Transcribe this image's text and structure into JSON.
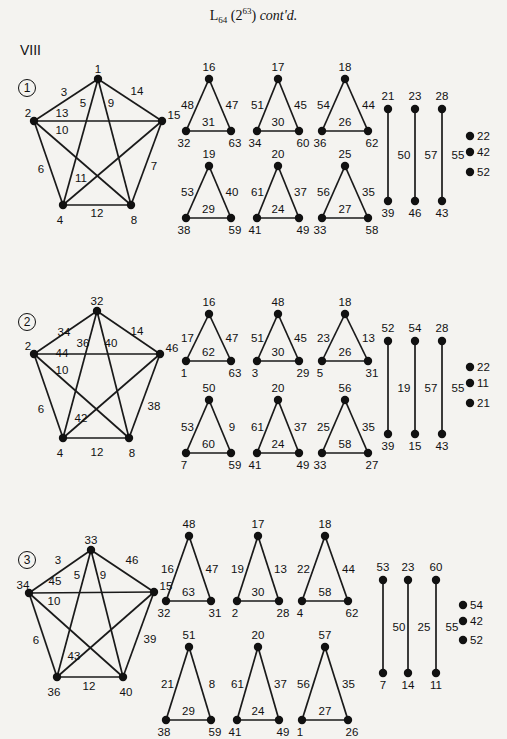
{
  "header": {
    "title_main": "L",
    "title_sub": "64",
    "title_paren_open": " (2",
    "title_sup": "63",
    "title_paren_close": ") ",
    "title_italic": "cont'd.",
    "section_roman": "VIII"
  },
  "graphs": [
    {
      "id": "1",
      "circle_label": "1",
      "pentagon": {
        "vertices": {
          "top": "1",
          "left": "2",
          "right": "15",
          "bottom_left": "4",
          "bottom_right": "8"
        },
        "edges": {
          "top-left": "3",
          "top-right": "14",
          "left-right": "13",
          "top-bottom_left": "5",
          "top-bottom_right": "9",
          "left-bottom_right": "10",
          "left-bottom_left": "6",
          "right-bottom_right": "7",
          "right-bottom_left": "11",
          "bottom_left-bottom_right": "12"
        }
      },
      "triangles": [
        {
          "apex": "16",
          "bl": "32",
          "br": "63",
          "left_edge": "48",
          "right_edge": "47",
          "base_edge": "31"
        },
        {
          "apex": "17",
          "bl": "34",
          "br": "60",
          "left_edge": "51",
          "right_edge": "45",
          "base_edge": "30"
        },
        {
          "apex": "18",
          "bl": "36",
          "br": "62",
          "left_edge": "54",
          "right_edge": "44",
          "base_edge": "26"
        },
        {
          "apex": "19",
          "bl": "38",
          "br": "59",
          "left_edge": "53",
          "right_edge": "40",
          "base_edge": "29"
        },
        {
          "apex": "20",
          "bl": "41",
          "br": "49",
          "left_edge": "61",
          "right_edge": "37",
          "base_edge": "24"
        },
        {
          "apex": "25",
          "bl": "33",
          "br": "58",
          "left_edge": "56",
          "right_edge": "35",
          "base_edge": "27"
        }
      ],
      "segments": [
        {
          "top": "21",
          "bottom": "39",
          "edge": "50"
        },
        {
          "top": "23",
          "bottom": "46",
          "edge": "57"
        },
        {
          "top": "28",
          "bottom": "43",
          "edge": "55"
        }
      ],
      "isolated": [
        "22",
        "42",
        "52"
      ]
    },
    {
      "id": "2",
      "circle_label": "2",
      "pentagon": {
        "vertices": {
          "top": "32",
          "left": "2",
          "right": "46",
          "bottom_left": "4",
          "bottom_right": "8"
        },
        "edges": {
          "top-left": "34",
          "top-right": "14",
          "left-right": "44",
          "top-bottom_left": "36",
          "top-bottom_right": "40",
          "left-bottom_right": "10",
          "left-bottom_left": "6",
          "right-bottom_right": "38",
          "right-bottom_left": "42",
          "bottom_left-bottom_right": "12"
        }
      },
      "triangles": [
        {
          "apex": "16",
          "bl": "1",
          "br": "63",
          "left_edge": "17",
          "right_edge": "47",
          "base_edge": "62"
        },
        {
          "apex": "48",
          "bl": "3",
          "br": "29",
          "left_edge": "51",
          "right_edge": "45",
          "base_edge": "30"
        },
        {
          "apex": "18",
          "bl": "5",
          "br": "31",
          "left_edge": "23",
          "right_edge": "13",
          "base_edge": "26"
        },
        {
          "apex": "50",
          "bl": "7",
          "br": "59",
          "left_edge": "53",
          "right_edge": "9",
          "base_edge": "60"
        },
        {
          "apex": "20",
          "bl": "41",
          "br": "49",
          "left_edge": "61",
          "right_edge": "37",
          "base_edge": "24"
        },
        {
          "apex": "56",
          "bl": "33",
          "br": "27",
          "left_edge": "25",
          "right_edge": "35",
          "base_edge": "58"
        }
      ],
      "segments": [
        {
          "top": "52",
          "bottom": "39",
          "edge": "19"
        },
        {
          "top": "54",
          "bottom": "15",
          "edge": "57"
        },
        {
          "top": "28",
          "bottom": "43",
          "edge": "55"
        }
      ],
      "isolated": [
        "22",
        "11",
        "21"
      ]
    },
    {
      "id": "3",
      "circle_label": "3",
      "pentagon": {
        "vertices": {
          "top": "33",
          "left": "34",
          "right": "15",
          "bottom_left": "36",
          "bottom_right": "40"
        },
        "edges": {
          "top-left": "3",
          "top-right": "46",
          "left-right": "45",
          "top-bottom_left": "5",
          "top-bottom_right": "9",
          "left-bottom_right": "10",
          "left-bottom_left": "6",
          "right-bottom_right": "39",
          "right-bottom_left": "43",
          "bottom_left-bottom_right": "12"
        }
      },
      "triangles": [
        {
          "apex": "48",
          "bl": "32",
          "br": "31",
          "left_edge": "16",
          "right_edge": "47",
          "base_edge": "63"
        },
        {
          "apex": "17",
          "bl": "2",
          "br": "28",
          "left_edge": "19",
          "right_edge": "13",
          "base_edge": "30"
        },
        {
          "apex": "18",
          "bl": "4",
          "br": "62",
          "left_edge": "22",
          "right_edge": "44",
          "base_edge": "58"
        },
        {
          "apex": "51",
          "bl": "38",
          "br": "59",
          "left_edge": "21",
          "right_edge": "8",
          "base_edge": "29"
        },
        {
          "apex": "20",
          "bl": "41",
          "br": "49",
          "left_edge": "61",
          "right_edge": "37",
          "base_edge": "24"
        },
        {
          "apex": "57",
          "bl": "1",
          "br": "26",
          "left_edge": "56",
          "right_edge": "35",
          "base_edge": "27"
        }
      ],
      "segments": [
        {
          "top": "53",
          "bottom": "7",
          "edge": "50"
        },
        {
          "top": "23",
          "bottom": "14",
          "edge": "25"
        },
        {
          "top": "60",
          "bottom": "11",
          "edge": "55"
        }
      ],
      "isolated": [
        "54",
        "42",
        "52"
      ]
    }
  ]
}
